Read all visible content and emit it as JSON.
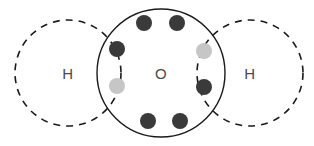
{
  "diagram": {
    "name": "water-molecule-lewis-dot-diagram",
    "background_color": "#ffffff",
    "canvas": {
      "width": 314,
      "height": 146
    },
    "atoms": [
      {
        "id": "hydrogen-left",
        "label": "H",
        "shell_style": "dashed",
        "stroke_color": "#1a1a1a",
        "cx": 68,
        "cy": 73,
        "r": 53,
        "label_x": 68,
        "label_y": 73
      },
      {
        "id": "oxygen-center",
        "label": "O",
        "shell_style": "solid",
        "stroke_color": "#1a1a1a",
        "cx": 161,
        "cy": 73,
        "r": 64,
        "label_x": 161,
        "label_y": 73
      },
      {
        "id": "hydrogen-right",
        "label": "H",
        "shell_style": "dashed",
        "stroke_color": "#1a1a1a",
        "cx": 250,
        "cy": 73,
        "r": 53,
        "label_x": 250,
        "label_y": 73
      }
    ],
    "electrons": [
      {
        "id": "electron-top-left",
        "owner": "oxygen",
        "color": "#3a3a3a",
        "cx": 144,
        "cy": 23,
        "r": 8
      },
      {
        "id": "electron-top-right",
        "owner": "oxygen",
        "color": "#3a3a3a",
        "cx": 177,
        "cy": 23,
        "r": 8
      },
      {
        "id": "electron-left-upper",
        "owner": "oxygen",
        "color": "#3a3a3a",
        "cx": 117,
        "cy": 49,
        "r": 8
      },
      {
        "id": "electron-left-lower-shared",
        "owner": "hydrogen",
        "color": "#c6c6c6",
        "cx": 117,
        "cy": 86,
        "r": 8
      },
      {
        "id": "electron-right-upper-shared",
        "owner": "hydrogen",
        "color": "#c6c6c6",
        "cx": 204,
        "cy": 51,
        "r": 8
      },
      {
        "id": "electron-right-lower",
        "owner": "oxygen",
        "color": "#3a3a3a",
        "cx": 204,
        "cy": 87,
        "r": 8
      },
      {
        "id": "electron-bottom-left",
        "owner": "oxygen",
        "color": "#3a3a3a",
        "cx": 148,
        "cy": 121,
        "r": 8
      },
      {
        "id": "electron-bottom-right",
        "owner": "oxygen",
        "color": "#3a3a3a",
        "cx": 180,
        "cy": 121,
        "r": 8
      }
    ],
    "legend": {
      "oxygen_electron_color": "#3a3a3a",
      "hydrogen_electron_color": "#c6c6c6",
      "label_color": "#4a4a4a"
    }
  }
}
